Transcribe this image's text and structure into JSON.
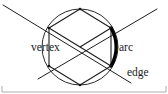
{
  "figure": {
    "background_color": "#ffffff",
    "ink_color": "#1d1d1d",
    "highlight_color": "#000000",
    "frame_color": "#9a9a9a",
    "width": 168,
    "height": 94
  },
  "labels": {
    "vertex": "vertex",
    "arc": "arc",
    "edge": "edge"
  },
  "label_positions": {
    "vertex": {
      "x": 31,
      "y": 51
    },
    "arc": {
      "x": 119,
      "y": 51
    },
    "edge": {
      "x": 127,
      "y": 76
    }
  },
  "geometry": {
    "circle": {
      "cx": 80,
      "cy": 47,
      "r": 38
    },
    "hexagon_points": "80,9 111,28 111,66 80,85 49,66 49,28",
    "hexagon_vertices": [
      {
        "x": 80,
        "y": 9
      },
      {
        "x": 111,
        "y": 28
      },
      {
        "x": 111,
        "y": 66
      },
      {
        "x": 80,
        "y": 85
      },
      {
        "x": 49,
        "y": 66
      },
      {
        "x": 49,
        "y": 28
      }
    ],
    "thick_arc_path": "M 111,28 A 38,38 0 0 1 111,66",
    "radius_to_top_right": {
      "x1": 80,
      "y1": 47,
      "x2": 111,
      "y2": 28
    },
    "radius_to_bottom_right": {
      "x1": 80,
      "y1": 47,
      "x2": 111,
      "y2": 66
    },
    "radius_to_left": {
      "x1": 80,
      "y1": 47,
      "x2": 49,
      "y2": 28
    },
    "line_through_center_a": {
      "x1": 3,
      "y1": 5,
      "x2": 131,
      "y2": 83
    },
    "line_through_center_b": {
      "x1": 38,
      "y1": 79,
      "x2": 157,
      "y2": 9
    },
    "frame_bottom": {
      "x1": 2,
      "y1": 92,
      "x2": 166,
      "y2": 92
    },
    "frame_left_tick": {
      "x1": 2,
      "y1": 86,
      "x2": 2,
      "y2": 92
    },
    "frame_right_tick": {
      "x1": 166,
      "y1": 86,
      "x2": 166,
      "y2": 92
    }
  }
}
